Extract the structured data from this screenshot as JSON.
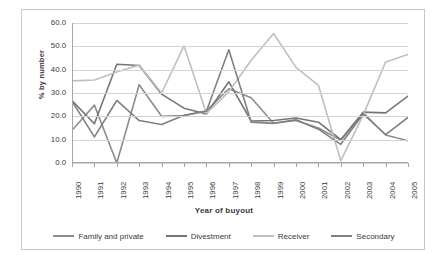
{
  "chart_data": {
    "type": "line",
    "title": "",
    "xlabel": "Year of buyout",
    "ylabel": "% by number",
    "ylim": [
      0,
      60
    ],
    "yticks": [
      "0.0",
      "10.0",
      "20.0",
      "30.0",
      "40.0",
      "50.0",
      "60.0"
    ],
    "grid": true,
    "legend_position": "bottom",
    "categories": [
      "1990",
      "1991",
      "1992",
      "1993",
      "1994",
      "1995",
      "1996",
      "1997",
      "1998",
      "1999",
      "2000",
      "2001",
      "2002",
      "2003",
      "2004",
      "2005"
    ],
    "series": [
      {
        "name": "Family and private",
        "color": "#8c8c8c",
        "values": [
          14.0,
          24.8,
          0.0,
          33.5,
          20.0,
          20.3,
          22.4,
          31.8,
          28.0,
          17.0,
          18.2,
          15.0,
          9.8,
          21.5,
          12.0,
          9.5
        ]
      },
      {
        "name": "Divestment",
        "color": "#757575",
        "values": [
          26.8,
          16.8,
          42.3,
          41.8,
          29.5,
          23.5,
          21.0,
          34.8,
          18.0,
          18.2,
          19.3,
          17.5,
          10.0,
          21.8,
          21.5,
          28.7
        ]
      },
      {
        "name": "Receiver",
        "color": "#bfbfbf",
        "values": [
          35.2,
          35.6,
          39.0,
          42.0,
          30.0,
          50.2,
          21.3,
          30.5,
          44.0,
          55.5,
          41.0,
          33.3,
          1.0,
          20.5,
          43.3,
          46.5
        ]
      },
      {
        "name": "Secondary",
        "color": "#808080",
        "values": [
          26.5,
          11.2,
          26.8,
          18.2,
          16.5,
          20.5,
          22.2,
          48.5,
          17.5,
          17.0,
          18.5,
          14.5,
          8.0,
          21.0,
          12.2,
          19.5
        ]
      }
    ]
  },
  "axis": {
    "x_title": "Year of buyout",
    "y_title": "% by number"
  },
  "legend": {
    "items": [
      {
        "label": "Family and private"
      },
      {
        "label": "Divestment"
      },
      {
        "label": "Receiver"
      },
      {
        "label": "Secondary"
      }
    ]
  }
}
